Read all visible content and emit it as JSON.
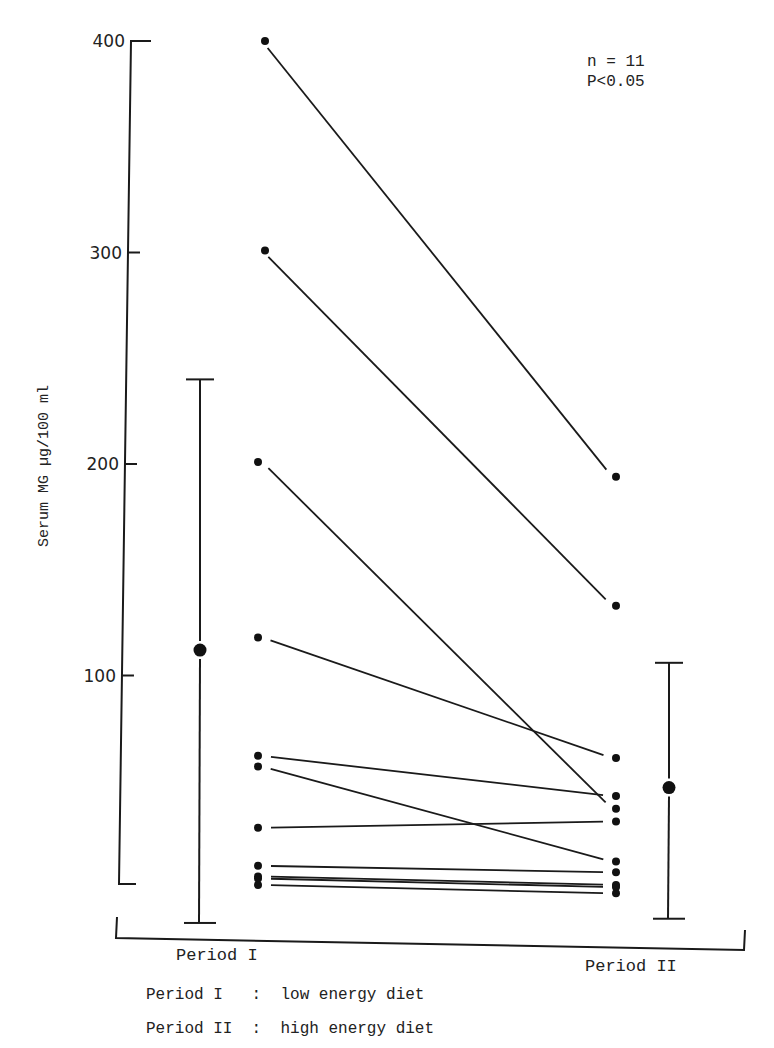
{
  "chart_data": {
    "type": "line",
    "title": "",
    "xlabel": "",
    "ylabel": "Serum MG µg/100 ml",
    "ylim": [
      0,
      400
    ],
    "yticks": [
      100,
      200,
      300,
      400
    ],
    "ytick_labels": [
      "100",
      "200",
      "300",
      "400"
    ],
    "categories": [
      "Period I",
      "Period II"
    ],
    "grid": false,
    "annotations": [
      "n = 11",
      "P<0.05"
    ],
    "subjects": [
      {
        "id": 1,
        "values": [
          400,
          194
        ]
      },
      {
        "id": 2,
        "values": [
          301,
          133
        ]
      },
      {
        "id": 3,
        "values": [
          201,
          37
        ]
      },
      {
        "id": 4,
        "values": [
          118,
          61
        ]
      },
      {
        "id": 5,
        "values": [
          62,
          43
        ]
      },
      {
        "id": 6,
        "values": [
          57,
          12
        ]
      },
      {
        "id": 7,
        "values": [
          28,
          31
        ]
      },
      {
        "id": 8,
        "values": [
          10,
          7
        ]
      },
      {
        "id": 9,
        "values": [
          5,
          1
        ]
      },
      {
        "id": 10,
        "values": [
          4,
          0
        ]
      },
      {
        "id": 11,
        "values": [
          1,
          -3
        ]
      }
    ],
    "summary": [
      {
        "period": "Period I",
        "mean": 112,
        "upper": 240,
        "lower": -17
      },
      {
        "period": "Period II",
        "mean": 47,
        "upper": 106,
        "lower": -15
      }
    ],
    "legend": [
      {
        "key": "Period I",
        "sep": ":",
        "desc": "low energy diet"
      },
      {
        "key": "Period II",
        "sep": ":",
        "desc": "high energy diet"
      }
    ]
  },
  "stats": {
    "n": "n = 11",
    "p": "P<0.05"
  },
  "axis": {
    "ylabel": "Serum MG µg/100 ml"
  },
  "xlabels": {
    "p1": "Period I",
    "p2": "Period II"
  },
  "legend": {
    "line1": "Period I   :  low energy diet",
    "line2": "Period II  :  high energy diet"
  }
}
